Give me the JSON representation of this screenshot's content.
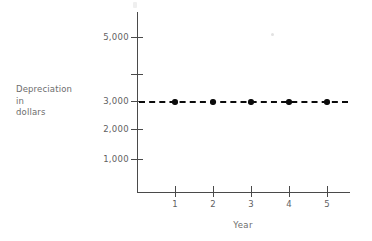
{
  "chart_data": {
    "type": "line",
    "title": "",
    "subtitle": "",
    "xlabel": "Year",
    "ylabel": "Depreciation in dollars",
    "ylabel_lines": [
      "Depreciation",
      "in",
      "dollars"
    ],
    "x": [
      1,
      2,
      3,
      4,
      5
    ],
    "categories": [
      "1",
      "2",
      "3",
      "4",
      "5"
    ],
    "series": [
      {
        "name": "Depreciation",
        "values": [
          3000,
          3000,
          3000,
          3000,
          3000
        ],
        "line_style": "dashed",
        "marker": "filled-circle",
        "color": "#0b0b0b"
      }
    ],
    "xlim": [
      0,
      5.9
    ],
    "ylim": [
      0,
      5600
    ],
    "ytick_values": [
      1000,
      2000,
      3000,
      4000,
      5000
    ],
    "ytick_labels": [
      "1,000",
      "2,000",
      "3,000",
      "",
      "5,000"
    ],
    "xtick_labels": [
      "1",
      "2",
      "3",
      "4",
      "5"
    ],
    "grid": false,
    "legend": false,
    "note": "4,000 gridline tick is drawn but not labeled"
  },
  "axes": {
    "y_title": {
      "line1": "Depreciation",
      "line2": "in",
      "line3": "dollars"
    },
    "x_title": "Year",
    "y_ticks": [
      {
        "label": "5,000",
        "value": 5000,
        "y": 37
      },
      {
        "label": "",
        "value": 4000,
        "y": 74
      },
      {
        "label": "3,000",
        "value": 3000,
        "y": 101
      },
      {
        "label": "2,000",
        "value": 2000,
        "y": 129
      },
      {
        "label": "1,000",
        "value": 1000,
        "y": 159
      }
    ],
    "x_ticks": [
      {
        "label": "1",
        "x": 175
      },
      {
        "label": "2",
        "x": 213
      },
      {
        "label": "3",
        "x": 251
      },
      {
        "label": "4",
        "x": 289
      },
      {
        "label": "5",
        "x": 327
      }
    ]
  },
  "series_points": [
    {
      "x": 175,
      "y": 101
    },
    {
      "x": 213,
      "y": 101
    },
    {
      "x": 251,
      "y": 101
    },
    {
      "x": 289,
      "y": 101
    },
    {
      "x": 327,
      "y": 101
    }
  ],
  "colors": {
    "axis": "#4a4a4a",
    "text": "#5f5f5f",
    "series": "#0b0b0b",
    "background": "#ffffff"
  }
}
